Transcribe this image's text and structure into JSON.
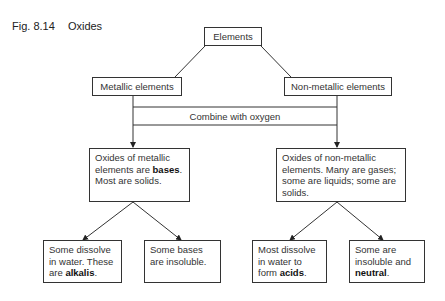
{
  "figure": {
    "number": "Fig. 8.14",
    "title": "Oxides"
  },
  "nodes": {
    "root": "Elements",
    "metallic": "Metallic elements",
    "nonmetallic": "Non-metallic elements",
    "process": "Combine with oxygen",
    "metal_oxides": {
      "pre": "Oxides of metallic elements are ",
      "bold": "bases",
      "post": ". Most are solids."
    },
    "nonmetal_oxides": {
      "text": "Oxides of non-metallic elements. Many are gases; some are liquids; some are solids."
    },
    "alkalis": {
      "pre": "Some dissolve in water. These are ",
      "bold": "alkalis",
      "post": "."
    },
    "insoluble_bases": {
      "text": "Some bases are insoluble."
    },
    "acids": {
      "pre": "Most dissolve in water to form ",
      "bold": "acids",
      "post": "."
    },
    "neutral": {
      "pre": "Some are insoluble and ",
      "bold": "neutral",
      "post": "."
    }
  },
  "colors": {
    "line": "#333333",
    "text": "#333333",
    "background": "#ffffff"
  }
}
